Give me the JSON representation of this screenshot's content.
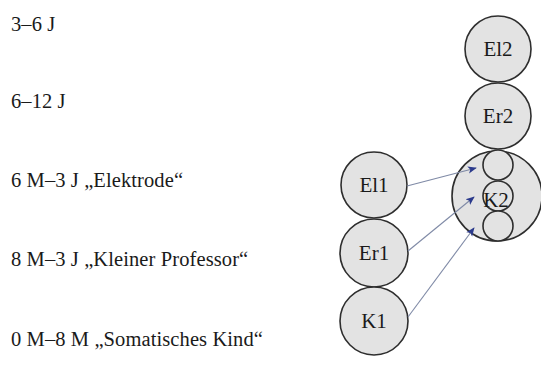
{
  "stages": [
    {
      "id": "s1",
      "label": "3–6 J"
    },
    {
      "id": "s2",
      "label": "6–12 J"
    },
    {
      "id": "s3",
      "label": "6 M–3 J „Elektrode“"
    },
    {
      "id": "s4",
      "label": "8 M–3 J „Kleiner Professor“"
    },
    {
      "id": "s5",
      "label": "0 M–8 M „Somatisches Kind“"
    }
  ],
  "nodes": {
    "el2": {
      "label": "El2"
    },
    "er2": {
      "label": "Er2"
    },
    "k2": {
      "label": "K2"
    },
    "el1": {
      "label": "El1"
    },
    "er1": {
      "label": "Er1"
    },
    "k1": {
      "label": "K1"
    }
  },
  "edges": [
    {
      "from": "El1",
      "to": "K2 (upper inner circle)"
    },
    {
      "from": "Er1",
      "to": "K2 (middle inner circle)"
    },
    {
      "from": "K1",
      "to": "K2 (lower inner circle)"
    }
  ],
  "colors": {
    "node_fill": "#e3e3e3",
    "node_stroke": "#2e2e2e",
    "arrow_line": "#7f8aa6",
    "arrow_head": "#2b3a8c"
  }
}
